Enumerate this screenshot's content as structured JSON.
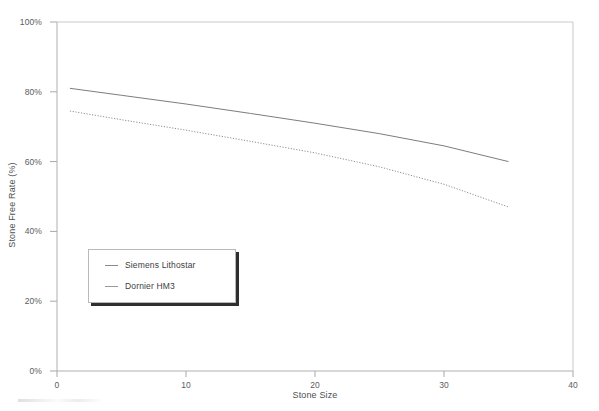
{
  "chart_data": {
    "type": "line",
    "title": "",
    "xlabel": "Stone Size",
    "ylabel": "Stone Free Rate (%)",
    "xlim": [
      0,
      40
    ],
    "ylim": [
      0,
      100
    ],
    "xticks": [
      "0",
      "10",
      "20",
      "30",
      "40"
    ],
    "xtick_values": [
      0,
      10,
      20,
      30,
      40
    ],
    "yticks": [
      "0%",
      "20%",
      "40%",
      "60%",
      "80%",
      "100%"
    ],
    "ytick_values": [
      0,
      20,
      40,
      60,
      80,
      100
    ],
    "grid": false,
    "legend_position": "lower-left-inside",
    "series": [
      {
        "name": "Siemens Lithostar",
        "style": "solid",
        "color": "#7d7d7d",
        "x": [
          1,
          5,
          10,
          15,
          20,
          25,
          30,
          35
        ],
        "values": [
          81,
          79,
          76.5,
          73.8,
          71,
          68,
          64.5,
          60
        ]
      },
      {
        "name": "Dornier HM3",
        "style": "dotted",
        "color": "#8f8f8f",
        "x": [
          1,
          5,
          10,
          15,
          20,
          25,
          30,
          35
        ],
        "values": [
          74.5,
          72,
          69,
          65.8,
          62.5,
          58.5,
          53.5,
          47
        ]
      }
    ]
  },
  "axes": {
    "y_title": "Stone Free Rate (%)",
    "x_title": "Stone Size"
  },
  "legend": {
    "items": [
      {
        "label": "Siemens Lithostar"
      },
      {
        "label": "Dornier HM3"
      }
    ]
  }
}
